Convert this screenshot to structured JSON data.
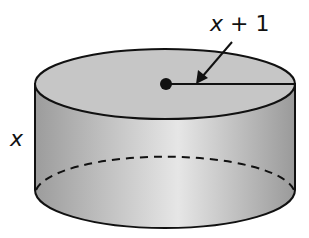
{
  "diagram": {
    "type": "cylinder",
    "labels": {
      "radius": "x + 1",
      "radius_var": "x",
      "radius_rest": " + 1",
      "height": "x"
    },
    "colors": {
      "fill_top": "#c8c8c8",
      "fill_side_dark": "#9a9a9a",
      "fill_side_light": "#e8e8e8",
      "stroke": "#111111"
    }
  }
}
